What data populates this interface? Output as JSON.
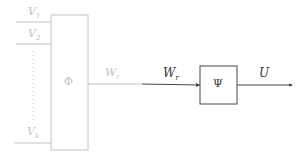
{
  "diagram": {
    "inputs": [
      {
        "label": "V",
        "sub": "1"
      },
      {
        "label": "V",
        "sub": "2"
      },
      {
        "label": "V",
        "sub": "k"
      }
    ],
    "block_phi": {
      "label": "Φ"
    },
    "block_psi": {
      "label": "Ψ"
    },
    "edge_phi_out": {
      "label": "W",
      "sub": "r"
    },
    "edge_psi_in": {
      "label": "W",
      "sub": "r"
    },
    "edge_psi_out": {
      "label": "U"
    },
    "colors": {
      "faded": "#bdbdbd",
      "dark": "#333333"
    }
  }
}
